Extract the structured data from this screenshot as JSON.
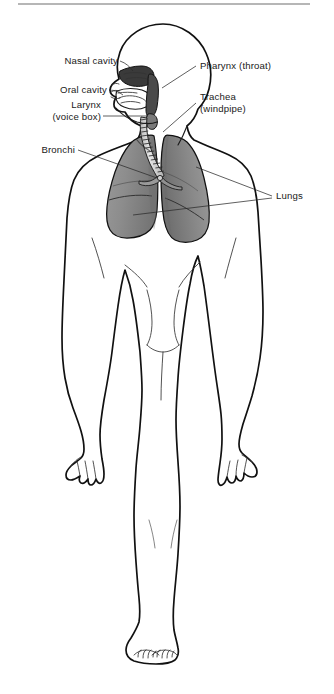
{
  "figure": {
    "view": "anterior full-body silhouette with left-facing head profile",
    "background_color": "#ffffff",
    "outline_color": "#111111",
    "top_rule": {
      "present": true,
      "color": "#6e6e6e",
      "x_start": 18,
      "x_end": 310,
      "y": 4
    }
  },
  "labels": {
    "nasal_cavity": "Nasal cavity",
    "oral_cavity": "Oral cavity",
    "larynx_line1": "Larynx",
    "larynx_line2": "(voice box)",
    "bronchi": "Bronchi",
    "pharynx": "Pharynx (throat)",
    "trachea_line1": "Trachea",
    "trachea_line2": "(windpipe)",
    "lungs": "Lungs"
  },
  "label_positions": {
    "nasal_cavity": {
      "x": 118,
      "y": 64,
      "align": "end"
    },
    "oral_cavity": {
      "x": 107,
      "y": 93,
      "align": "end"
    },
    "larynx_line1": {
      "x": 101,
      "y": 108,
      "align": "end"
    },
    "larynx_line2": {
      "x": 101,
      "y": 120,
      "align": "end"
    },
    "bronchi": {
      "x": 75,
      "y": 153,
      "align": "end"
    },
    "pharynx": {
      "x": 200,
      "y": 69,
      "align": "start"
    },
    "trachea_line1": {
      "x": 200,
      "y": 100,
      "align": "start"
    },
    "trachea_line2": {
      "x": 200,
      "y": 112,
      "align": "start"
    },
    "lungs": {
      "x": 276,
      "y": 199,
      "align": "start"
    }
  },
  "anatomy_parts": [
    {
      "name": "nasal-cavity",
      "fill": "#3a3a3a",
      "description": "dark shaded nasal passage above palate"
    },
    {
      "name": "oral-cavity",
      "fill": "#ffffff",
      "description": "mouth cavity with tongue outline"
    },
    {
      "name": "pharynx",
      "fill": "#4a4a4a",
      "description": "throat passage behind tongue"
    },
    {
      "name": "larynx",
      "fill": "#6a6a6a",
      "description": "voice box at top of trachea"
    },
    {
      "name": "trachea",
      "fill": "#d8d8d8",
      "description": "segmented windpipe with cartilage rings"
    },
    {
      "name": "bronchi",
      "fill": "#9a9a9a",
      "description": "branching airways entering lungs"
    },
    {
      "name": "left-lung",
      "fill": "#8d8d8d",
      "description": "gray shaded lung, viewer left"
    },
    {
      "name": "right-lung",
      "fill": "#858585",
      "description": "gray shaded lung, viewer right"
    }
  ],
  "colors": {
    "lung_fill": "#8d8d8d",
    "lung_fill_dark": "#757575",
    "airway_dark": "#3a3a3a",
    "trachea_fill": "#dcdcdc",
    "leader_line": "#2b2b2b",
    "text": "#1a1a1a"
  }
}
